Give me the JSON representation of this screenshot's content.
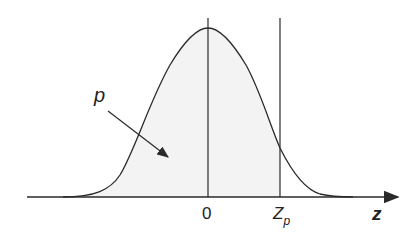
{
  "diagram": {
    "labels": {
      "origin": "0",
      "zp_main": "Z",
      "zp_sub": "p",
      "axis": "z",
      "area": "p"
    },
    "colors": {
      "curve": "#2a2a2a",
      "fill": "#f3f3f3",
      "axis": "#2a2a2a"
    }
  }
}
